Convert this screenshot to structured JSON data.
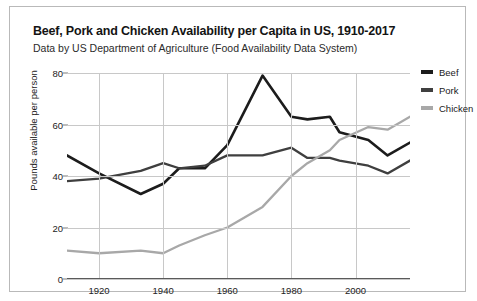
{
  "title": "Beef, Pork and Chicken Availability per Capita in US, 1910-2017",
  "subtitle": "Data by US Department of Agriculture (Food Availability Data System)",
  "legend": {
    "items": [
      {
        "label": "Beef",
        "color": "#1c1c1c"
      },
      {
        "label": "Pork",
        "color": "#3f3f3f"
      },
      {
        "label": "Chicken",
        "color": "#a8a8a8"
      }
    ]
  },
  "chart_data": {
    "type": "line",
    "title": "Beef, Pork and Chicken Availability per Capita in US, 1910-2017",
    "subtitle": "Data by US Department of Agriculture (Food Availability Data System)",
    "xlabel": "",
    "ylabel": "Pounds available per person",
    "xlim": [
      1910,
      2017
    ],
    "ylim": [
      0,
      80
    ],
    "xticks": [
      1920,
      1940,
      1960,
      1980,
      2000
    ],
    "yticks": [
      0,
      20,
      40,
      60,
      80
    ],
    "grid": true,
    "legend_position": "right",
    "series": [
      {
        "name": "Beef",
        "color": "#1c1c1c",
        "x": [
          1910,
          1920,
          1933,
          1940,
          1945,
          1953,
          1960,
          1971,
          1980,
          1985,
          1992,
          1995,
          2004,
          2010,
          2017
        ],
        "values": [
          48,
          41,
          33,
          37,
          43,
          43,
          52,
          79,
          63,
          62,
          63,
          57,
          54,
          48,
          53
        ]
      },
      {
        "name": "Pork",
        "color": "#3f3f3f",
        "x": [
          1910,
          1920,
          1933,
          1940,
          1945,
          1953,
          1960,
          1971,
          1980,
          1985,
          1992,
          1995,
          2004,
          2010,
          2017
        ],
        "values": [
          38,
          39,
          42,
          45,
          43,
          44,
          48,
          48,
          51,
          47,
          47,
          46,
          44,
          41,
          46
        ]
      },
      {
        "name": "Chicken",
        "color": "#a8a8a8",
        "x": [
          1910,
          1920,
          1933,
          1940,
          1945,
          1953,
          1960,
          1971,
          1980,
          1985,
          1992,
          1995,
          2004,
          2010,
          2017
        ],
        "values": [
          11,
          10,
          11,
          10,
          13,
          17,
          20,
          28,
          40,
          45,
          50,
          54,
          59,
          58,
          63
        ]
      }
    ]
  }
}
